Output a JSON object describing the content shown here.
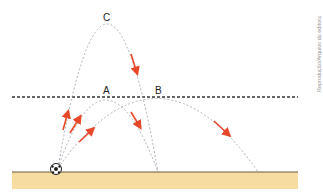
{
  "diagram": {
    "labels": {
      "a": "A",
      "b": "B",
      "c": "C"
    },
    "credit": "Reprodução/Arquivo da editora",
    "elements": {
      "reference_line": "horizontal dashed line",
      "ground": "sand ground",
      "ball": "soccer ball",
      "trajectories": [
        "C (high arc)",
        "A (medium arc)",
        "B (long arc)"
      ]
    },
    "colors": {
      "arrow": "#e8482a",
      "trajectory": "#9aa0a8",
      "ground": "#f6dca0",
      "ground_line": "#6b5a3a",
      "dashed_line": "#333333"
    }
  }
}
